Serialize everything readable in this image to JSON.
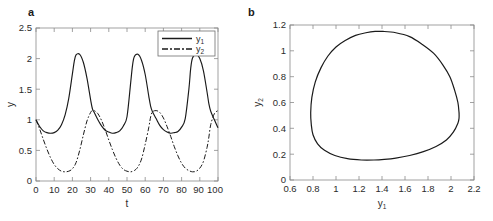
{
  "figure": {
    "panels": [
      {
        "label": "a"
      },
      {
        "label": "b"
      }
    ]
  },
  "panel_a": {
    "label": "a",
    "xlabel": "t",
    "ylabel": "y",
    "xticks": [
      "0",
      "10",
      "20",
      "30",
      "40",
      "50",
      "60",
      "70",
      "80",
      "90",
      "100"
    ],
    "yticks": [
      "0",
      "0.5",
      "1",
      "1.5",
      "2",
      "2.5"
    ],
    "legend": [
      {
        "name": "y",
        "sub": "1",
        "style": "solid"
      },
      {
        "name": "y",
        "sub": "2",
        "style": "dashdot"
      }
    ]
  },
  "panel_b": {
    "label": "b",
    "xlabel": "y",
    "xlabel_sub": "1",
    "ylabel": "y",
    "ylabel_sub": "2",
    "xticks": [
      "0.6",
      "0.8",
      "1",
      "1.2",
      "1.4",
      "1.6",
      "1.8",
      "2",
      "2.2"
    ],
    "yticks": [
      "0",
      "0.2",
      "0.4",
      "0.6",
      "0.8",
      "1",
      "1.2"
    ]
  },
  "chart_data": [
    {
      "type": "line",
      "panel": "a",
      "title": "",
      "xlabel": "t",
      "ylabel": "y",
      "xlim": [
        0,
        100
      ],
      "ylim": [
        0,
        2.5
      ],
      "xticks": [
        0,
        10,
        20,
        30,
        40,
        50,
        60,
        70,
        80,
        90,
        100
      ],
      "yticks": [
        0,
        0.5,
        1,
        1.5,
        2,
        2.5
      ],
      "grid": false,
      "legend_position": "top-right",
      "series": [
        {
          "name": "y1",
          "style": "solid",
          "color": "#1a1a1a",
          "min": 0.78,
          "max": 2.07,
          "period": 32,
          "x": [
            0,
            2,
            4,
            6,
            8,
            10,
            12,
            14,
            16,
            18,
            20,
            21,
            22,
            24,
            26,
            28,
            30,
            31,
            32,
            34,
            36,
            38,
            40,
            42,
            44,
            46,
            48,
            50,
            52,
            53,
            54,
            56,
            58,
            60,
            62,
            63,
            64,
            66,
            68,
            70,
            72,
            74,
            76,
            78,
            80,
            82,
            84,
            85,
            86,
            88,
            90,
            92,
            94,
            95,
            96,
            98,
            100
          ],
          "values": [
            1.0,
            0.89,
            0.82,
            0.79,
            0.78,
            0.79,
            0.83,
            0.92,
            1.08,
            1.35,
            1.75,
            1.95,
            2.06,
            2.07,
            1.94,
            1.68,
            1.33,
            1.18,
            1.12,
            1.0,
            0.9,
            0.83,
            0.8,
            0.78,
            0.79,
            0.82,
            0.9,
            1.05,
            1.6,
            1.88,
            2.03,
            2.07,
            1.97,
            1.74,
            1.38,
            1.22,
            1.13,
            1.02,
            0.91,
            0.84,
            0.8,
            0.78,
            0.79,
            0.81,
            0.88,
            1.02,
            1.5,
            1.84,
            2.01,
            2.07,
            2.0,
            1.8,
            1.45,
            1.26,
            1.14,
            1.0,
            0.87
          ]
        },
        {
          "name": "y2",
          "style": "dashdot",
          "color": "#1a1a1a",
          "min": 0.15,
          "max": 1.15,
          "period": 32,
          "x": [
            0,
            2,
            4,
            6,
            8,
            10,
            12,
            14,
            16,
            18,
            20,
            22,
            24,
            26,
            28,
            30,
            31,
            32,
            34,
            36,
            38,
            40,
            42,
            44,
            46,
            48,
            50,
            52,
            54,
            56,
            58,
            60,
            62,
            63,
            64,
            66,
            68,
            70,
            72,
            74,
            76,
            78,
            80,
            82,
            84,
            86,
            88,
            90,
            92,
            94,
            95,
            96,
            98,
            100
          ],
          "values": [
            1.0,
            0.85,
            0.68,
            0.52,
            0.38,
            0.27,
            0.2,
            0.16,
            0.15,
            0.16,
            0.2,
            0.3,
            0.5,
            0.75,
            0.98,
            1.12,
            1.15,
            1.15,
            1.1,
            0.99,
            0.84,
            0.67,
            0.51,
            0.37,
            0.26,
            0.19,
            0.16,
            0.15,
            0.17,
            0.23,
            0.36,
            0.6,
            0.88,
            1.05,
            1.13,
            1.15,
            1.12,
            1.03,
            0.89,
            0.73,
            0.56,
            0.41,
            0.29,
            0.21,
            0.17,
            0.15,
            0.16,
            0.21,
            0.32,
            0.55,
            0.72,
            0.92,
            1.1,
            1.15
          ]
        }
      ]
    },
    {
      "type": "line",
      "panel": "b",
      "title": "",
      "xlabel": "y1",
      "ylabel": "y2",
      "xlim": [
        0.6,
        2.2
      ],
      "ylim": [
        0,
        1.2
      ],
      "xticks": [
        0.6,
        0.8,
        1,
        1.2,
        1.4,
        1.6,
        1.8,
        2,
        2.2
      ],
      "yticks": [
        0,
        0.2,
        0.4,
        0.6,
        0.8,
        1,
        1.2
      ],
      "grid": false,
      "legend_position": "none",
      "series": [
        {
          "name": "limit-cycle",
          "style": "solid",
          "color": "#1a1a1a",
          "closed": true,
          "x1_range": [
            0.78,
            2.07
          ],
          "x2_range": [
            0.15,
            1.15
          ],
          "x": [
            2.07,
            2.06,
            2.03,
            1.99,
            1.93,
            1.85,
            1.75,
            1.64,
            1.52,
            1.41,
            1.34,
            1.26,
            1.17,
            1.08,
            1.0,
            0.93,
            0.87,
            0.82,
            0.79,
            0.78,
            0.785,
            0.8,
            0.84,
            0.9,
            0.99,
            1.1,
            1.22,
            1.33,
            1.42,
            1.52,
            1.64,
            1.76,
            1.87,
            1.96,
            2.02,
            2.06,
            2.07,
            2.07
          ],
          "y": [
            0.52,
            0.6,
            0.7,
            0.8,
            0.89,
            0.98,
            1.05,
            1.11,
            1.14,
            1.15,
            1.15,
            1.14,
            1.12,
            1.08,
            1.03,
            0.96,
            0.87,
            0.76,
            0.64,
            0.52,
            0.43,
            0.35,
            0.28,
            0.23,
            0.19,
            0.165,
            0.155,
            0.155,
            0.16,
            0.17,
            0.19,
            0.22,
            0.26,
            0.31,
            0.37,
            0.44,
            0.48,
            0.52
          ]
        }
      ]
    }
  ]
}
